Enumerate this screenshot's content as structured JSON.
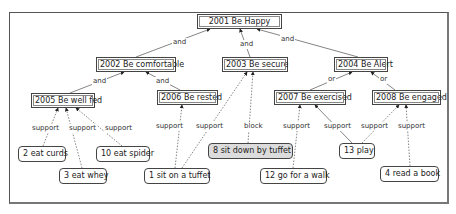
{
  "diagram": {
    "nodes": [
      {
        "id": "n2001",
        "label": "2001 Be Happy",
        "type": "goal",
        "x": 197,
        "y": 14,
        "w": 85
      },
      {
        "id": "n2002",
        "label": "2002 Be comfortable",
        "type": "goal",
        "x": 96,
        "y": 57,
        "w": 80
      },
      {
        "id": "n2003",
        "label": "2003 Be secure",
        "type": "goal",
        "x": 222,
        "y": 57,
        "w": 66
      },
      {
        "id": "n2004",
        "label": "2004 Be Alert",
        "type": "goal",
        "x": 334,
        "y": 57,
        "w": 54
      },
      {
        "id": "n2005",
        "label": "2005 Be well fed",
        "type": "goal",
        "x": 31,
        "y": 93,
        "w": 64
      },
      {
        "id": "n2006",
        "label": "2006 Be rested",
        "type": "goal",
        "x": 157,
        "y": 90,
        "w": 61
      },
      {
        "id": "n2007",
        "label": "2007 Be exercised",
        "type": "goal",
        "x": 274,
        "y": 90,
        "w": 72
      },
      {
        "id": "n2008",
        "label": "2008 Be engaged",
        "type": "goal",
        "x": 372,
        "y": 90,
        "w": 69
      },
      {
        "id": "t2",
        "label": "2 eat curds",
        "type": "task",
        "x": 18,
        "y": 146,
        "w": 48
      },
      {
        "id": "t3",
        "label": "3 eat whey",
        "type": "task",
        "x": 59,
        "y": 168,
        "w": 48
      },
      {
        "id": "t10",
        "label": "10 eat spider",
        "type": "task",
        "x": 96,
        "y": 146,
        "w": 54
      },
      {
        "id": "t1",
        "label": "1 sit on a tuffet",
        "type": "task",
        "x": 144,
        "y": 168,
        "w": 66
      },
      {
        "id": "t8",
        "label": "8 sit down by tuffet",
        "type": "task",
        "shaded": true,
        "x": 208,
        "y": 143,
        "w": 85
      },
      {
        "id": "t12",
        "label": "12 go for a walk",
        "type": "task",
        "x": 260,
        "y": 168,
        "w": 67
      },
      {
        "id": "t13",
        "label": "13 play",
        "type": "task",
        "x": 339,
        "y": 143,
        "w": 36
      },
      {
        "id": "t4",
        "label": "4 read a book",
        "type": "task",
        "x": 380,
        "y": 166,
        "w": 59
      }
    ],
    "edges": [
      {
        "from": [
          136,
          57
        ],
        "to": [
          210,
          29
        ],
        "label": "and",
        "lx": 172,
        "ly": 38,
        "style": "solid"
      },
      {
        "from": [
          250,
          57
        ],
        "to": [
          240,
          29
        ],
        "label": "and",
        "lx": 239,
        "ly": 40,
        "style": "solid"
      },
      {
        "from": [
          358,
          57
        ],
        "to": [
          257,
          29
        ],
        "label": "and",
        "lx": 280,
        "ly": 35,
        "style": "solid"
      },
      {
        "from": [
          70,
          93
        ],
        "to": [
          124,
          72
        ],
        "label": "and",
        "lx": 92,
        "ly": 77,
        "style": "solid"
      },
      {
        "from": [
          180,
          90
        ],
        "to": [
          146,
          72
        ],
        "label": "and",
        "lx": 155,
        "ly": 77,
        "style": "solid"
      },
      {
        "from": [
          310,
          90
        ],
        "to": [
          352,
          72
        ],
        "label": "or",
        "lx": 327,
        "ly": 75,
        "style": "solid"
      },
      {
        "from": [
          395,
          90
        ],
        "to": [
          371,
          72
        ],
        "label": "or",
        "lx": 379,
        "ly": 75,
        "style": "solid"
      },
      {
        "from": [
          43,
          146
        ],
        "to": [
          58,
          108
        ],
        "label": "support",
        "lx": 31,
        "ly": 124,
        "style": "dashed"
      },
      {
        "from": [
          82,
          168
        ],
        "to": [
          66,
          108
        ],
        "label": "support",
        "lx": 68,
        "ly": 124,
        "style": "dashed"
      },
      {
        "from": [
          122,
          146
        ],
        "to": [
          76,
          108
        ],
        "label": "support",
        "lx": 104,
        "ly": 124,
        "style": "dashed"
      },
      {
        "from": [
          175,
          168
        ],
        "to": [
          182,
          105
        ],
        "label": "support",
        "lx": 155,
        "ly": 122,
        "style": "dashed"
      },
      {
        "from": [
          182,
          168
        ],
        "to": [
          247,
          72
        ],
        "label": "support",
        "lx": 195,
        "ly": 122,
        "style": "dashed"
      },
      {
        "from": [
          248,
          143
        ],
        "to": [
          253,
          72
        ],
        "label": "block",
        "lx": 243,
        "ly": 122,
        "style": "dashed"
      },
      {
        "from": [
          293,
          168
        ],
        "to": [
          300,
          105
        ],
        "label": "support",
        "lx": 282,
        "ly": 122,
        "style": "dashed"
      },
      {
        "from": [
          352,
          143
        ],
        "to": [
          315,
          105
        ],
        "label": "support",
        "lx": 323,
        "ly": 122,
        "style": "solid"
      },
      {
        "from": [
          362,
          143
        ],
        "to": [
          399,
          105
        ],
        "label": "support",
        "lx": 360,
        "ly": 122,
        "style": "dashed"
      },
      {
        "from": [
          410,
          166
        ],
        "to": [
          406,
          105
        ],
        "label": "support",
        "lx": 397,
        "ly": 122,
        "style": "dashed"
      }
    ]
  }
}
